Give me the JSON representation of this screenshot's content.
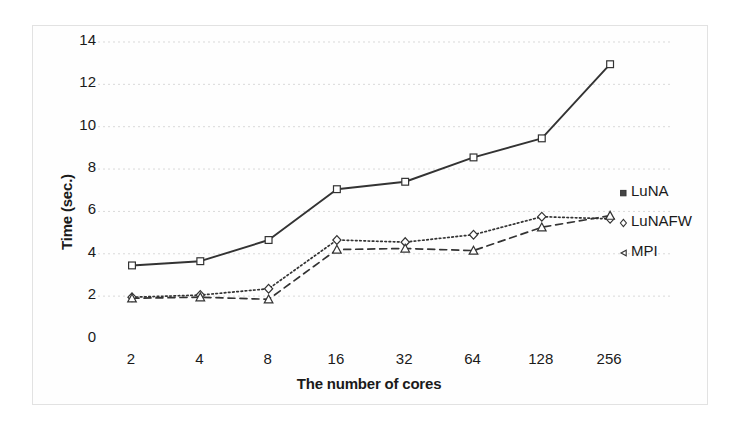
{
  "chart_data": {
    "type": "line",
    "title": "",
    "subtitle": "",
    "xlabel": "The number of cores",
    "ylabel": "Time (sec.)",
    "categories": [
      "2",
      "4",
      "8",
      "16",
      "32",
      "64",
      "128",
      "256"
    ],
    "ylim": [
      0,
      14
    ],
    "yticks": [
      "0",
      "2",
      "4",
      "6",
      "8",
      "10",
      "12",
      "14"
    ],
    "grid": "horizontal-dotted",
    "legend_position": "right-middle",
    "series": [
      {
        "name": "LuNA",
        "marker": "square",
        "line_style": "solid",
        "color": "#333333",
        "values": [
          3.45,
          3.65,
          4.65,
          7.05,
          7.4,
          8.55,
          9.45,
          12.95
        ]
      },
      {
        "name": "LuNAFW",
        "marker": "diamond",
        "line_style": "dotted",
        "color": "#333333",
        "values": [
          1.95,
          2.05,
          2.35,
          4.65,
          4.55,
          4.9,
          5.75,
          5.65
        ]
      },
      {
        "name": "MPI",
        "marker": "triangle",
        "line_style": "dashed",
        "color": "#333333",
        "values": [
          1.9,
          1.95,
          1.85,
          4.2,
          4.25,
          4.15,
          5.25,
          5.8
        ]
      }
    ]
  },
  "legend": {
    "items": [
      {
        "label": "LuNA",
        "marker": "square-marker-icon"
      },
      {
        "label": "LuNAFW",
        "marker": "diamond-marker-icon"
      },
      {
        "label": "MPI",
        "marker": "triangle-marker-icon"
      }
    ]
  },
  "colors": {
    "ink": "#1a1a1a",
    "line": "#333333",
    "grid": "#d9d9d9",
    "frame": "#e2e2e2",
    "background": "#ffffff"
  }
}
